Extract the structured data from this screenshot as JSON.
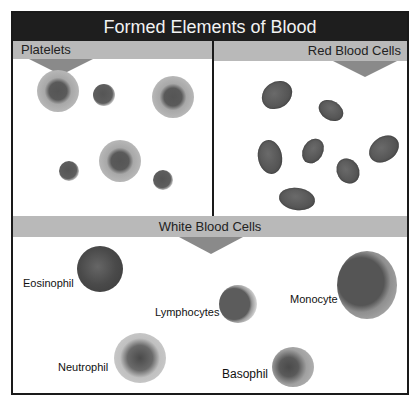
{
  "title": "Formed Elements of Blood",
  "panels": {
    "platelets": {
      "label": "Platelets"
    },
    "red_blood_cells": {
      "label": "Red Blood Cells"
    },
    "white_blood_cells": {
      "label": "White Blood Cells",
      "cells": [
        {
          "name": "Eosinophil"
        },
        {
          "name": "Lymphocytes"
        },
        {
          "name": "Monocyte"
        },
        {
          "name": "Neutrophil"
        },
        {
          "name": "Basophil"
        }
      ]
    }
  },
  "colors": {
    "title_bar": "#1e1e1e",
    "strip": "#b9b9b9",
    "arrow": "#8a8a8a",
    "cell_dark": "#555555"
  }
}
